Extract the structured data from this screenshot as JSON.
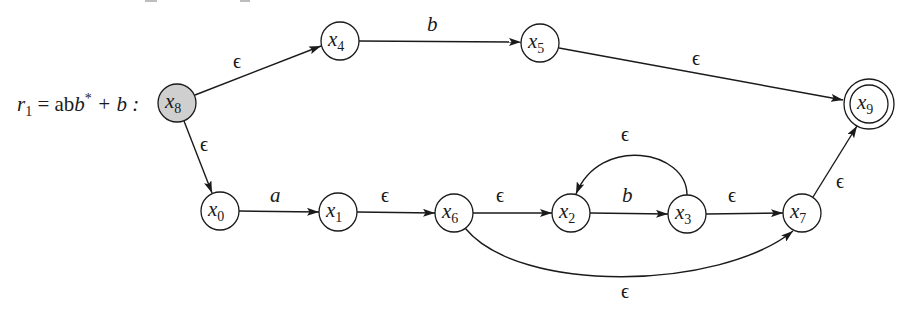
{
  "figure": {
    "expression_label": {
      "prefix": "r",
      "subscript": "1",
      "equals": " = ab",
      "star": "*",
      "rest": " + b :"
    },
    "accent_colors": {
      "stroke": "#1a1a1a",
      "start_fill": "#cfcfcf",
      "node_fill": "#ffffff"
    },
    "nodes": [
      {
        "id": "x8",
        "base": "x",
        "sub": "8",
        "cx": 177,
        "cy": 103,
        "type": "start"
      },
      {
        "id": "x4",
        "base": "x",
        "sub": "4",
        "cx": 340,
        "cy": 41,
        "type": "normal"
      },
      {
        "id": "x5",
        "base": "x",
        "sub": "5",
        "cx": 540,
        "cy": 43,
        "type": "normal"
      },
      {
        "id": "x9",
        "base": "x",
        "sub": "9",
        "cx": 869,
        "cy": 104,
        "type": "accept"
      },
      {
        "id": "x0",
        "base": "x",
        "sub": "0",
        "cx": 220,
        "cy": 211,
        "type": "normal"
      },
      {
        "id": "x1",
        "base": "x",
        "sub": "1",
        "cx": 338,
        "cy": 212,
        "type": "normal"
      },
      {
        "id": "x6",
        "base": "x",
        "sub": "6",
        "cx": 454,
        "cy": 213,
        "type": "normal"
      },
      {
        "id": "x2",
        "base": "x",
        "sub": "2",
        "cx": 571,
        "cy": 213,
        "type": "normal"
      },
      {
        "id": "x3",
        "base": "x",
        "sub": "3",
        "cx": 687,
        "cy": 214,
        "type": "normal"
      },
      {
        "id": "x7",
        "base": "x",
        "sub": "7",
        "cx": 802,
        "cy": 213,
        "type": "normal"
      }
    ],
    "edges": [
      {
        "from": "x8",
        "to": "x4",
        "label": "ϵ"
      },
      {
        "from": "x4",
        "to": "x5",
        "label": "b"
      },
      {
        "from": "x5",
        "to": "x9",
        "label": "ϵ"
      },
      {
        "from": "x8",
        "to": "x0",
        "label": "ϵ"
      },
      {
        "from": "x0",
        "to": "x1",
        "label": "a"
      },
      {
        "from": "x1",
        "to": "x6",
        "label": "ϵ"
      },
      {
        "from": "x6",
        "to": "x2",
        "label": "ϵ"
      },
      {
        "from": "x2",
        "to": "x3",
        "label": "b"
      },
      {
        "from": "x3",
        "to": "x2",
        "label": "ϵ"
      },
      {
        "from": "x3",
        "to": "x7",
        "label": "ϵ"
      },
      {
        "from": "x6",
        "to": "x7",
        "label": "ϵ"
      },
      {
        "from": "x7",
        "to": "x9",
        "label": "ϵ"
      }
    ]
  }
}
